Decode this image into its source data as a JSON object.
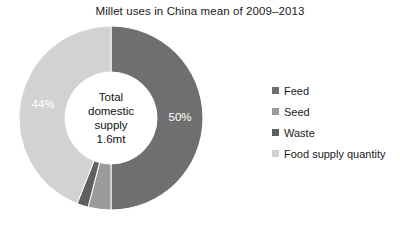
{
  "chart_data": {
    "type": "pie",
    "variant": "donut",
    "title": "Millet uses in China mean of 2009–2013",
    "xlabel": "",
    "ylabel": "",
    "categories": [
      "Feed",
      "Seed",
      "Waste",
      "Food supply quantity"
    ],
    "values": [
      50,
      4,
      2,
      44
    ],
    "value_labels": [
      "50%",
      "4%",
      "2%",
      "44%"
    ],
    "colors": [
      "#6f6f6f",
      "#9b9b9b",
      "#5f5f5f",
      "#d2d2d2"
    ],
    "label_color": "#ffffff",
    "start_angle_deg": 0,
    "direction": "clockwise",
    "hole_ratio": 0.5,
    "legend_position": "right",
    "grid": false,
    "center_annotation": {
      "line1": "Total",
      "line2": "domestic",
      "line3": "supply",
      "line4": "1.6mt"
    }
  },
  "legend": {
    "items": [
      {
        "label": "Feed",
        "color": "#6f6f6f"
      },
      {
        "label": "Seed",
        "color": "#9b9b9b"
      },
      {
        "label": "Waste",
        "color": "#5f5f5f"
      },
      {
        "label": "Food supply quantity",
        "color": "#d2d2d2"
      }
    ]
  }
}
